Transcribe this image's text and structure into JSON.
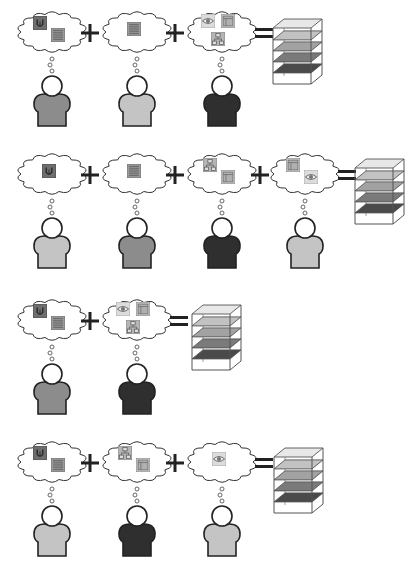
{
  "diagram": {
    "colors": {
      "outline": "#222222",
      "cloud_stroke": "#333333",
      "person_light": "#c4c4c4",
      "person_mid": "#8c8c8c",
      "person_dark": "#2f2f2f",
      "icon_dark": "#6e6e6e",
      "icon_mid": "#9a9a9a",
      "icon_light": "#c8c8c8",
      "layer_colors": [
        "#e8e8e8",
        "#c2c2c2",
        "#a2a2a2",
        "#7a7a7a",
        "#4a4a4a"
      ]
    },
    "rows": [
      {
        "id": "row-1",
        "y": 8,
        "operators": [
          "+",
          "+",
          "="
        ],
        "persons": [
          {
            "x": 15,
            "shade": "mid",
            "icons": [
              "lightbulb",
              "list"
            ]
          },
          {
            "x": 100,
            "shade": "light",
            "icons": [
              "list"
            ]
          },
          {
            "x": 185,
            "shade": "dark",
            "icons": [
              "eye",
              "window",
              "network"
            ]
          }
        ],
        "stack": {
          "x": 272,
          "y": 18
        }
      },
      {
        "id": "row-2",
        "y": 150,
        "operators": [
          "+",
          "+",
          "+",
          "="
        ],
        "persons": [
          {
            "x": 15,
            "shade": "light",
            "icons": [
              "lightbulb"
            ]
          },
          {
            "x": 100,
            "shade": "mid",
            "icons": [
              "list"
            ]
          },
          {
            "x": 185,
            "shade": "dark",
            "icons": [
              "network",
              "window"
            ]
          },
          {
            "x": 268,
            "shade": "light",
            "icons": [
              "window",
              "eye"
            ]
          }
        ],
        "stack": {
          "x": 354,
          "y": 158
        }
      },
      {
        "id": "row-3",
        "y": 296,
        "operators": [
          "+",
          "="
        ],
        "persons": [
          {
            "x": 15,
            "shade": "mid",
            "icons": [
              "lightbulb",
              "list"
            ]
          },
          {
            "x": 100,
            "shade": "dark",
            "icons": [
              "eye",
              "window",
              "network"
            ]
          }
        ],
        "stack": {
          "x": 191,
          "y": 304
        }
      },
      {
        "id": "row-4",
        "y": 438,
        "operators": [
          "+",
          "+",
          "="
        ],
        "persons": [
          {
            "x": 15,
            "shade": "light",
            "icons": [
              "lightbulb",
              "list"
            ]
          },
          {
            "x": 100,
            "shade": "dark",
            "icons": [
              "network",
              "window"
            ]
          },
          {
            "x": 185,
            "shade": "light",
            "icons": [
              "eye"
            ]
          }
        ],
        "stack": {
          "x": 273,
          "y": 447
        }
      }
    ]
  }
}
